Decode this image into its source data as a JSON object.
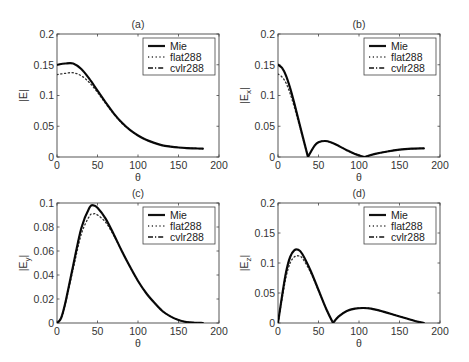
{
  "figure": {
    "panels": [
      "(a)",
      "(b)",
      "(c)",
      "(d)"
    ],
    "xlabel": "θ"
  },
  "legend": {
    "entries": [
      {
        "label": "Mie",
        "style": "solid"
      },
      {
        "label": "flat288",
        "style": "dotted"
      },
      {
        "label": "cvlr288",
        "style": "dashdot"
      }
    ]
  },
  "chart_data": [
    {
      "type": "line",
      "title": "(a)",
      "xlabel": "θ",
      "ylabel": "|E|",
      "xlim": [
        0,
        200
      ],
      "ylim": [
        0,
        0.2
      ],
      "xticks": [
        0,
        50,
        100,
        150,
        200
      ],
      "yticks": [
        0,
        0.05,
        0.1,
        0.15,
        0.2
      ],
      "ytick_labels": [
        "0",
        "0.05",
        "0.1",
        "0.15",
        "0.2"
      ],
      "legend_position": "upper right",
      "grid": false,
      "x": [
        0,
        10,
        20,
        30,
        40,
        50,
        60,
        70,
        80,
        90,
        100,
        110,
        120,
        130,
        140,
        150,
        160,
        170,
        180
      ],
      "series": [
        {
          "name": "Mie",
          "values": [
            0.15,
            0.152,
            0.152,
            0.143,
            0.127,
            0.108,
            0.089,
            0.071,
            0.056,
            0.044,
            0.035,
            0.028,
            0.023,
            0.019,
            0.017,
            0.0155,
            0.0145,
            0.014,
            0.0135
          ]
        },
        {
          "name": "flat288",
          "values": [
            0.134,
            0.136,
            0.137,
            0.132,
            0.121,
            0.105,
            0.087,
            0.07,
            0.055,
            0.044,
            0.035,
            0.028,
            0.023,
            0.019,
            0.017,
            0.0155,
            0.0145,
            0.014,
            0.0135
          ]
        },
        {
          "name": "cvlr288",
          "values": [
            0.15,
            0.152,
            0.152,
            0.143,
            0.127,
            0.108,
            0.089,
            0.071,
            0.056,
            0.044,
            0.035,
            0.028,
            0.023,
            0.019,
            0.017,
            0.0155,
            0.0145,
            0.014,
            0.0135
          ]
        }
      ]
    },
    {
      "type": "line",
      "title": "(b)",
      "xlabel": "θ",
      "ylabel": "|E_x|",
      "xlim": [
        0,
        200
      ],
      "ylim": [
        0,
        0.2
      ],
      "xticks": [
        0,
        50,
        100,
        150,
        200
      ],
      "yticks": [
        0,
        0.05,
        0.1,
        0.15,
        0.2
      ],
      "ytick_labels": [
        "0",
        "0.05",
        "0.1",
        "0.15",
        "0.2"
      ],
      "legend_position": "upper right",
      "grid": false,
      "x": [
        0,
        5,
        10,
        15,
        20,
        25,
        30,
        37,
        45,
        50,
        58,
        65,
        75,
        85,
        95,
        107,
        120,
        135,
        150,
        165,
        180
      ],
      "series": [
        {
          "name": "Mie",
          "values": [
            0.15,
            0.145,
            0.132,
            0.112,
            0.088,
            0.062,
            0.036,
            0.0,
            0.018,
            0.024,
            0.026,
            0.024,
            0.018,
            0.011,
            0.005,
            0.0,
            0.005,
            0.009,
            0.012,
            0.0135,
            0.014
          ]
        },
        {
          "name": "flat288",
          "values": [
            0.135,
            0.13,
            0.12,
            0.103,
            0.082,
            0.058,
            0.034,
            0.0,
            0.018,
            0.024,
            0.026,
            0.024,
            0.018,
            0.011,
            0.005,
            0.0,
            0.005,
            0.009,
            0.012,
            0.0135,
            0.014
          ]
        },
        {
          "name": "cvlr288",
          "values": [
            0.15,
            0.145,
            0.132,
            0.112,
            0.088,
            0.062,
            0.036,
            0.0,
            0.018,
            0.024,
            0.026,
            0.024,
            0.018,
            0.011,
            0.005,
            0.0,
            0.005,
            0.009,
            0.012,
            0.0135,
            0.014
          ]
        }
      ]
    },
    {
      "type": "line",
      "title": "(c)",
      "xlabel": "θ",
      "ylabel": "|E_y|",
      "xlim": [
        0,
        200
      ],
      "ylim": [
        0,
        0.1
      ],
      "xticks": [
        0,
        50,
        100,
        150,
        200
      ],
      "yticks": [
        0,
        0.02,
        0.04,
        0.06,
        0.08,
        0.1
      ],
      "ytick_labels": [
        "0",
        "0.02",
        "0.04",
        "0.06",
        "0.08",
        "0.1"
      ],
      "legend_position": "upper right",
      "grid": false,
      "x": [
        0,
        5,
        10,
        20,
        30,
        40,
        45,
        50,
        60,
        70,
        80,
        90,
        100,
        110,
        120,
        130,
        140,
        150,
        160,
        170,
        180
      ],
      "series": [
        {
          "name": "Mie",
          "values": [
            0.0,
            0.004,
            0.016,
            0.048,
            0.079,
            0.096,
            0.098,
            0.096,
            0.087,
            0.074,
            0.06,
            0.047,
            0.035,
            0.025,
            0.017,
            0.01,
            0.0055,
            0.0025,
            0.0008,
            0.0002,
            0.0
          ]
        },
        {
          "name": "flat288",
          "values": [
            0.0,
            0.004,
            0.015,
            0.045,
            0.074,
            0.089,
            0.091,
            0.09,
            0.084,
            0.073,
            0.06,
            0.047,
            0.035,
            0.025,
            0.017,
            0.01,
            0.0055,
            0.0025,
            0.0008,
            0.0002,
            0.0
          ]
        },
        {
          "name": "cvlr288",
          "values": [
            0.0,
            0.004,
            0.016,
            0.048,
            0.079,
            0.096,
            0.098,
            0.096,
            0.087,
            0.074,
            0.06,
            0.047,
            0.035,
            0.025,
            0.017,
            0.01,
            0.0055,
            0.0025,
            0.0008,
            0.0002,
            0.0
          ]
        }
      ]
    },
    {
      "type": "line",
      "title": "(d)",
      "xlabel": "θ",
      "ylabel": "|E_z|",
      "xlim": [
        0,
        200
      ],
      "ylim": [
        0,
        0.2
      ],
      "xticks": [
        0,
        50,
        100,
        150,
        200
      ],
      "yticks": [
        0,
        0.05,
        0.1,
        0.15,
        0.2
      ],
      "ytick_labels": [
        "0",
        "0.05",
        "0.1",
        "0.15",
        "0.2"
      ],
      "legend_position": "upper right",
      "grid": false,
      "x": [
        0,
        5,
        10,
        15,
        20,
        25,
        30,
        40,
        50,
        60,
        68,
        75,
        85,
        95,
        105,
        115,
        130,
        145,
        160,
        170,
        180
      ],
      "series": [
        {
          "name": "Mie",
          "values": [
            0.0,
            0.045,
            0.085,
            0.11,
            0.121,
            0.122,
            0.115,
            0.088,
            0.055,
            0.022,
            0.0,
            0.011,
            0.02,
            0.024,
            0.025,
            0.024,
            0.019,
            0.013,
            0.007,
            0.003,
            0.0
          ]
        },
        {
          "name": "flat288",
          "values": [
            0.0,
            0.04,
            0.077,
            0.1,
            0.11,
            0.112,
            0.108,
            0.085,
            0.054,
            0.022,
            0.0,
            0.011,
            0.02,
            0.024,
            0.025,
            0.024,
            0.019,
            0.013,
            0.007,
            0.003,
            0.0
          ]
        },
        {
          "name": "cvlr288",
          "values": [
            0.0,
            0.045,
            0.085,
            0.11,
            0.121,
            0.122,
            0.115,
            0.088,
            0.055,
            0.022,
            0.0,
            0.011,
            0.02,
            0.024,
            0.025,
            0.024,
            0.019,
            0.013,
            0.007,
            0.003,
            0.0
          ]
        }
      ]
    }
  ]
}
